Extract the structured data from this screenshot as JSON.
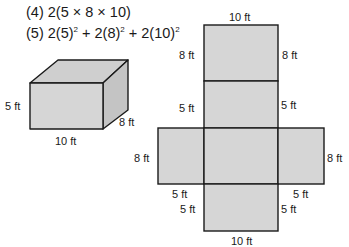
{
  "expressions": {
    "line4": {
      "prefix": "(4) 2(5 × 8 × 10)"
    },
    "line5": {
      "prefix": "(5) 2(5)",
      "p1": "2",
      "mid1": " + 2(8)",
      "p2": "2",
      "mid2": " + 2(10)",
      "p3": "2"
    }
  },
  "box": {
    "height_label": "5 ft",
    "width_label": "10 ft",
    "depth_label": "8 ft"
  },
  "net": {
    "top_width_label": "10 ft",
    "top_left_label": "8 ft",
    "top_right_label": "8 ft",
    "second_left_label": "5 ft",
    "second_right_label": "5 ft",
    "middle_left_label": "8 ft",
    "middle_right_label": "8 ft",
    "left_bottom_label": "5 ft",
    "right_bottom_label": "5 ft",
    "bottom_left_label": "5 ft",
    "bottom_right_label": "5 ft",
    "bottom_width_label": "10 ft"
  },
  "colors": {
    "fill": "#d6d6d6",
    "fill_top": "#cfcfcf",
    "fill_side": "#c4c4c4",
    "stroke": "#1a1a1a"
  }
}
